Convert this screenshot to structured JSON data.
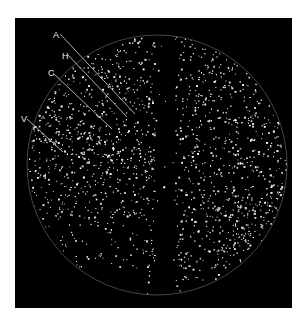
{
  "figure": {
    "background": "#000000",
    "dot_color": "#ffffff",
    "circle": {
      "cx": 142,
      "cy": 147,
      "r": 130
    },
    "dark_band": {
      "x": 140,
      "width": 20
    },
    "labels": [
      {
        "id": "A",
        "text": "A",
        "x": 38,
        "y": 13,
        "line": [
          45,
          16,
          120,
          96
        ]
      },
      {
        "id": "H",
        "text": "H",
        "x": 47,
        "y": 34,
        "line": [
          53,
          37,
          112,
          99
        ]
      },
      {
        "id": "C",
        "text": "C",
        "x": 33,
        "y": 51,
        "line": [
          38,
          55,
          97,
          111
        ]
      },
      {
        "id": "V",
        "text": "V",
        "x": 6,
        "y": 97,
        "line": [
          12,
          101,
          48,
          134
        ]
      }
    ]
  }
}
